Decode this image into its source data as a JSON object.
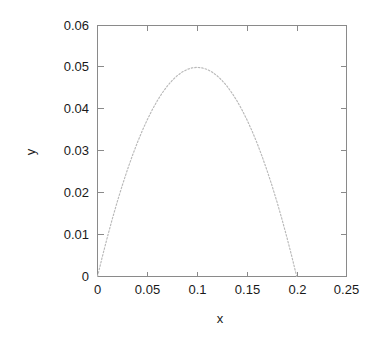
{
  "chart_data": {
    "type": "line",
    "title": "",
    "subtitle": "",
    "xlabel": "x",
    "ylabel": "y",
    "xlim": [
      0,
      0.25
    ],
    "ylim": [
      0,
      0.06
    ],
    "grid": false,
    "legend": null,
    "x_ticks": [
      0,
      0.05,
      0.1,
      0.15,
      0.2,
      0.25
    ],
    "x_tick_labels": [
      "0",
      "0.05",
      "0.1",
      "0.15",
      "0.2",
      "0.25"
    ],
    "y_ticks": [
      0,
      0.01,
      0.02,
      0.03,
      0.04,
      0.05,
      0.06
    ],
    "y_tick_labels": [
      "0",
      "0.01",
      "0.02",
      "0.03",
      "0.04",
      "0.05",
      "0.06"
    ],
    "line_style": "dotted",
    "line_color": "#b9b9b9",
    "frame_color": "#8a8a8a",
    "background_color": "#ffffff",
    "series": [
      {
        "name": "parabola",
        "equation": "y = 5x(0.2 - x)",
        "x": [
          0,
          0.005,
          0.01,
          0.015,
          0.02,
          0.025,
          0.03,
          0.035,
          0.04,
          0.045,
          0.05,
          0.055,
          0.06,
          0.065,
          0.07,
          0.075,
          0.08,
          0.085,
          0.09,
          0.095,
          0.1,
          0.105,
          0.11,
          0.115,
          0.12,
          0.125,
          0.13,
          0.135,
          0.14,
          0.145,
          0.15,
          0.155,
          0.16,
          0.165,
          0.17,
          0.175,
          0.18,
          0.185,
          0.19,
          0.195,
          0.2
        ],
        "y": [
          0,
          0.004875,
          0.0095,
          0.013875,
          0.018,
          0.021875,
          0.0255,
          0.028875,
          0.032,
          0.034875,
          0.0375,
          0.039875,
          0.042,
          0.043875,
          0.0455,
          0.046875,
          0.048,
          0.048875,
          0.0495,
          0.049875,
          0.05,
          0.049875,
          0.0495,
          0.048875,
          0.048,
          0.046875,
          0.0455,
          0.043875,
          0.042,
          0.039875,
          0.0375,
          0.034875,
          0.032,
          0.028875,
          0.0255,
          0.021875,
          0.018,
          0.013875,
          0.0095,
          0.004875,
          0
        ]
      }
    ],
    "annotations": {
      "peak_x": 0.1,
      "peak_y": 0.05,
      "root_left": 0,
      "root_right": 0.2
    }
  }
}
